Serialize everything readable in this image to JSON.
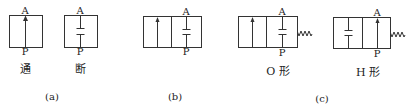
{
  "diagram": {
    "type": "valve-symbols",
    "stroke_color": "#333333",
    "groups": [
      {
        "id": "a",
        "label": "(a)",
        "symbols": [
          {
            "id": "open",
            "caption": "通",
            "ports": {
              "top": "A",
              "bottom": "P"
            },
            "positions": [
              "flow-up"
            ],
            "spring": false
          },
          {
            "id": "closed",
            "caption": "断",
            "ports": {
              "top": "A",
              "bottom": "P"
            },
            "positions": [
              "blocked"
            ],
            "spring": false
          }
        ]
      },
      {
        "id": "b",
        "label": "(b)",
        "symbols": [
          {
            "id": "two-position",
            "caption": "",
            "ports": {
              "top": "A",
              "bottom": "P"
            },
            "positions": [
              "flow-up",
              "blocked"
            ],
            "spring": false
          }
        ]
      },
      {
        "id": "c",
        "label": "(c)",
        "symbols": [
          {
            "id": "o-type",
            "caption": "O 形",
            "ports": {
              "top": "A",
              "bottom": "P"
            },
            "positions": [
              "flow-up",
              "blocked"
            ],
            "spring": true
          },
          {
            "id": "h-type",
            "caption": "H 形",
            "ports": {
              "top": "A",
              "bottom": "P"
            },
            "positions": [
              "blocked",
              "flow-up"
            ],
            "spring": true
          }
        ]
      }
    ]
  }
}
